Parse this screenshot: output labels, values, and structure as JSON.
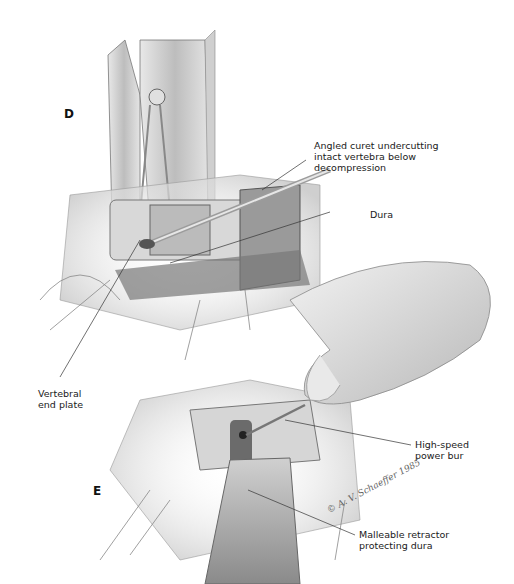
{
  "figure": {
    "panels": [
      {
        "letter": "D",
        "labels": {
          "curet": [
            "Angled curet undercutting",
            "intact vertebra below",
            "decompression"
          ],
          "dura": "Dura",
          "endplate": [
            "Vertebral",
            "end plate"
          ]
        }
      },
      {
        "letter": "E",
        "labels": {
          "bur": [
            "High-speed",
            "power bur"
          ],
          "retractor": [
            "Malleable retractor",
            "protecting dura"
          ]
        }
      }
    ],
    "signature": "© A. V. Schaeffer 1985",
    "colors": {
      "ink": "#1a1a1a",
      "shade_dark": "#6e6e6e",
      "shade_mid": "#a8a8a8",
      "shade_light": "#d9d9d9",
      "background": "#ffffff"
    }
  }
}
